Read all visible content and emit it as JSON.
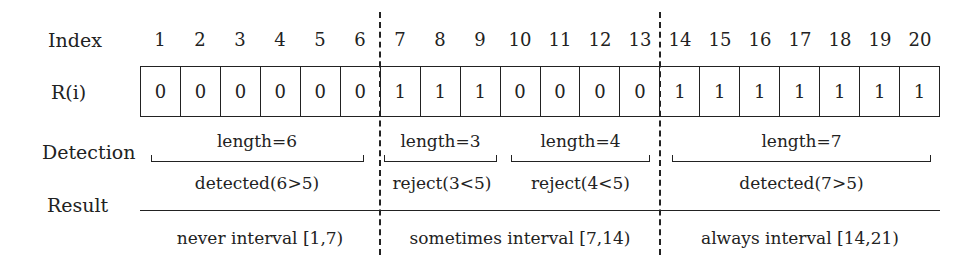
{
  "row_labels": {
    "index": "Index",
    "r": "R(i)",
    "detection": "Detection",
    "result": "Result"
  },
  "indices": [
    "1",
    "2",
    "3",
    "4",
    "5",
    "6",
    "7",
    "8",
    "9",
    "10",
    "11",
    "12",
    "13",
    "14",
    "15",
    "16",
    "17",
    "18",
    "19",
    "20"
  ],
  "values": [
    "0",
    "0",
    "0",
    "0",
    "0",
    "0",
    "1",
    "1",
    "1",
    "0",
    "0",
    "0",
    "0",
    "1",
    "1",
    "1",
    "1",
    "1",
    "1",
    "1"
  ],
  "detection": [
    {
      "length": "length=6",
      "verdict": "detected(6>5)"
    },
    {
      "length": "length=3",
      "verdict": "reject(3<5)"
    },
    {
      "length": "length=4",
      "verdict": "reject(4<5)"
    },
    {
      "length": "length=7",
      "verdict": "detected(7>5)"
    }
  ],
  "results": [
    {
      "label": "never interval [1,7)"
    },
    {
      "label": "sometimes interval [7,14)"
    },
    {
      "label": "always interval [14,21)"
    }
  ]
}
